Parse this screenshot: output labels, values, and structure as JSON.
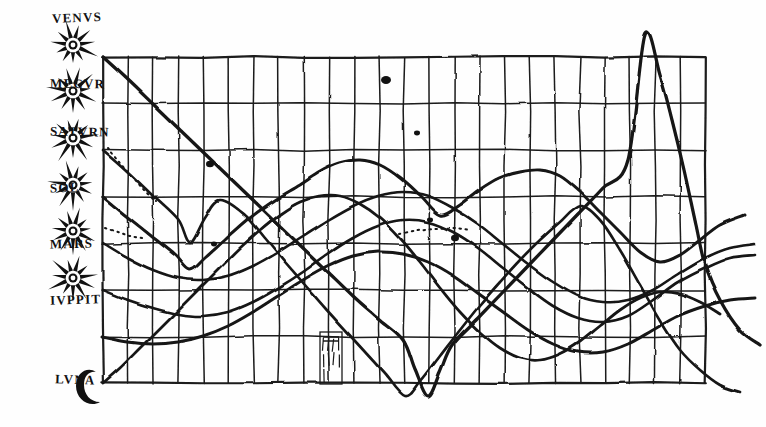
{
  "figure": {
    "medium": "ink on parchment facsimile",
    "ink_color": "#1a1a1a",
    "paper_color": "#fefefe"
  },
  "axis": {
    "label_header": "",
    "glyph_name": "eight-pointed-star",
    "moon_glyph_name": "crescent-moon",
    "bodies": [
      {
        "id": "venus",
        "label": "VENVS",
        "row": 0,
        "y": 57,
        "label_y": 10,
        "glyph": "star"
      },
      {
        "id": "mercury",
        "label": "MECVR",
        "row": 1,
        "y": 103,
        "label_y": 76,
        "glyph": "star"
      },
      {
        "id": "saturn",
        "label": "SATVRN",
        "row": 2,
        "y": 150,
        "label_y": 124,
        "glyph": "star"
      },
      {
        "id": "sol",
        "label": "SOL",
        "row": 3,
        "y": 197,
        "label_y": 180,
        "glyph": "star"
      },
      {
        "id": "mars",
        "label": "MARS",
        "row": 4,
        "y": 243,
        "label_y": 236,
        "glyph": "star"
      },
      {
        "id": "jupiter",
        "label": "IVPPIT",
        "row": 5,
        "y": 290,
        "label_y": 292,
        "glyph": "star"
      },
      {
        "id": "luna",
        "label": "LVNA",
        "row": 6,
        "y": 337,
        "label_y": 372,
        "glyph": "crescent"
      }
    ]
  },
  "annotations": [
    {
      "id": "hatched-cell",
      "name": "tally-hatch-mark",
      "x": 320,
      "y": 332,
      "w": 22,
      "h": 52,
      "text": ""
    }
  ],
  "chart_data": {
    "type": "line",
    "xlabel": "",
    "ylabel": "",
    "grid": true,
    "legend_position": "left-axis",
    "axis_note": "Left axis rows are labelled with the seven classical planets; horizontal axis is an unlabelled time grid of ~24 equal columns.",
    "grid_spec": {
      "x0": 103,
      "x1": 705,
      "y0": 57,
      "y1": 383,
      "columns": 24,
      "rows": 7,
      "col_step": 25.1,
      "row_step": 46.6
    },
    "categories": [
      "1",
      "2",
      "3",
      "4",
      "5",
      "6",
      "7",
      "8",
      "9",
      "10",
      "11",
      "12",
      "13",
      "14",
      "15",
      "16",
      "17",
      "18",
      "19",
      "20",
      "21",
      "22",
      "23",
      "24"
    ],
    "series": [
      {
        "name": "VENVS",
        "id": "venus",
        "style": "solid",
        "points": [
          [
            103,
            57
          ],
          [
            128,
            80
          ],
          [
            153,
            104
          ],
          [
            178,
            128
          ],
          [
            203,
            152
          ],
          [
            228,
            176
          ],
          [
            253,
            200
          ],
          [
            278,
            224
          ],
          [
            303,
            248
          ],
          [
            328,
            272
          ],
          [
            353,
            296
          ],
          [
            378,
            318
          ],
          [
            403,
            340
          ],
          [
            415,
            370
          ],
          [
            428,
            396
          ],
          [
            440,
            372
          ],
          [
            452,
            345
          ],
          [
            478,
            318
          ],
          [
            503,
            292
          ],
          [
            528,
            266
          ],
          [
            553,
            240
          ],
          [
            578,
            214
          ],
          [
            603,
            188
          ],
          [
            628,
            160
          ],
          [
            645,
            35
          ],
          [
            660,
            75
          ],
          [
            672,
            120
          ],
          [
            684,
            170
          ],
          [
            696,
            225
          ],
          [
            705,
            265
          ],
          [
            720,
            300
          ],
          [
            740,
            330
          ],
          [
            760,
            345
          ]
        ]
      },
      {
        "name": "MECVR",
        "id": "mercury",
        "style": "solid",
        "points": [
          [
            103,
            150
          ],
          [
            128,
            172
          ],
          [
            153,
            196
          ],
          [
            178,
            220
          ],
          [
            190,
            243
          ],
          [
            205,
            218
          ],
          [
            220,
            200
          ],
          [
            245,
            215
          ],
          [
            265,
            238
          ],
          [
            285,
            262
          ],
          [
            305,
            285
          ],
          [
            325,
            308
          ],
          [
            345,
            330
          ],
          [
            365,
            352
          ],
          [
            385,
            374
          ],
          [
            405,
            396
          ],
          [
            420,
            382
          ],
          [
            440,
            356
          ],
          [
            460,
            330
          ],
          [
            480,
            305
          ],
          [
            500,
            282
          ],
          [
            520,
            260
          ],
          [
            540,
            240
          ],
          [
            560,
            222
          ],
          [
            580,
            206
          ],
          [
            600,
            220
          ],
          [
            620,
            250
          ],
          [
            640,
            285
          ],
          [
            660,
            320
          ],
          [
            680,
            350
          ],
          [
            700,
            370
          ],
          [
            720,
            385
          ],
          [
            740,
            392
          ]
        ]
      },
      {
        "name": "SATVRN",
        "id": "saturn",
        "style": "solid",
        "points": [
          [
            103,
            197
          ],
          [
            125,
            215
          ],
          [
            150,
            235
          ],
          [
            175,
            255
          ],
          [
            190,
            270
          ],
          [
            205,
            258
          ],
          [
            225,
            240
          ],
          [
            250,
            218
          ],
          [
            275,
            200
          ],
          [
            300,
            185
          ],
          [
            320,
            172
          ],
          [
            340,
            163
          ],
          [
            360,
            160
          ],
          [
            380,
            165
          ],
          [
            400,
            178
          ],
          [
            420,
            196
          ],
          [
            440,
            215
          ],
          [
            460,
            205
          ],
          [
            480,
            190
          ],
          [
            500,
            178
          ],
          [
            520,
            172
          ],
          [
            540,
            170
          ],
          [
            560,
            176
          ],
          [
            580,
            192
          ],
          [
            600,
            212
          ],
          [
            620,
            232
          ],
          [
            640,
            252
          ],
          [
            660,
            262
          ],
          [
            680,
            255
          ],
          [
            700,
            240
          ],
          [
            720,
            225
          ],
          [
            745,
            215
          ]
        ]
      },
      {
        "name": "SOL",
        "id": "sol",
        "style": "solid",
        "points": [
          [
            103,
            243
          ],
          [
            128,
            258
          ],
          [
            153,
            270
          ],
          [
            178,
            278
          ],
          [
            203,
            280
          ],
          [
            228,
            276
          ],
          [
            253,
            266
          ],
          [
            278,
            252
          ],
          [
            303,
            236
          ],
          [
            328,
            220
          ],
          [
            353,
            206
          ],
          [
            378,
            196
          ],
          [
            403,
            192
          ],
          [
            428,
            196
          ],
          [
            453,
            208
          ],
          [
            478,
            224
          ],
          [
            503,
            244
          ],
          [
            528,
            264
          ],
          [
            553,
            282
          ],
          [
            578,
            296
          ],
          [
            603,
            302
          ],
          [
            628,
            300
          ],
          [
            653,
            290
          ],
          [
            678,
            274
          ],
          [
            705,
            258
          ],
          [
            730,
            248
          ],
          [
            755,
            244
          ]
        ]
      },
      {
        "name": "MARS",
        "id": "mars",
        "style": "solid",
        "points": [
          [
            103,
            290
          ],
          [
            128,
            300
          ],
          [
            153,
            308
          ],
          [
            178,
            314
          ],
          [
            203,
            316
          ],
          [
            228,
            312
          ],
          [
            253,
            302
          ],
          [
            278,
            288
          ],
          [
            303,
            272
          ],
          [
            328,
            254
          ],
          [
            353,
            238
          ],
          [
            378,
            226
          ],
          [
            403,
            220
          ],
          [
            428,
            222
          ],
          [
            453,
            232
          ],
          [
            478,
            248
          ],
          [
            503,
            268
          ],
          [
            528,
            288
          ],
          [
            553,
            306
          ],
          [
            578,
            318
          ],
          [
            603,
            322
          ],
          [
            628,
            316
          ],
          [
            653,
            300
          ],
          [
            678,
            282
          ],
          [
            705,
            268
          ],
          [
            730,
            258
          ],
          [
            755,
            255
          ]
        ]
      },
      {
        "name": "IVPPIT",
        "id": "jupiter",
        "style": "solid",
        "points": [
          [
            103,
            337
          ],
          [
            128,
            342
          ],
          [
            153,
            344
          ],
          [
            178,
            342
          ],
          [
            203,
            336
          ],
          [
            228,
            326
          ],
          [
            253,
            312
          ],
          [
            278,
            296
          ],
          [
            303,
            280
          ],
          [
            328,
            266
          ],
          [
            353,
            256
          ],
          [
            378,
            252
          ],
          [
            403,
            254
          ],
          [
            428,
            262
          ],
          [
            453,
            276
          ],
          [
            478,
            294
          ],
          [
            503,
            312
          ],
          [
            528,
            330
          ],
          [
            553,
            344
          ],
          [
            578,
            352
          ],
          [
            603,
            352
          ],
          [
            628,
            344
          ],
          [
            653,
            330
          ],
          [
            678,
            316
          ],
          [
            705,
            306
          ],
          [
            730,
            300
          ],
          [
            755,
            298
          ]
        ]
      },
      {
        "name": "LVNA",
        "id": "luna",
        "style": "solid",
        "points": [
          [
            103,
            383
          ],
          [
            120,
            368
          ],
          [
            140,
            348
          ],
          [
            160,
            328
          ],
          [
            180,
            308
          ],
          [
            200,
            288
          ],
          [
            220,
            268
          ],
          [
            240,
            248
          ],
          [
            260,
            230
          ],
          [
            280,
            214
          ],
          [
            300,
            202
          ],
          [
            320,
            196
          ],
          [
            340,
            196
          ],
          [
            360,
            204
          ],
          [
            380,
            218
          ],
          [
            400,
            238
          ],
          [
            420,
            262
          ],
          [
            440,
            288
          ],
          [
            460,
            312
          ],
          [
            480,
            332
          ],
          [
            500,
            348
          ],
          [
            520,
            358
          ],
          [
            540,
            360
          ],
          [
            560,
            354
          ],
          [
            580,
            342
          ],
          [
            600,
            326
          ],
          [
            620,
            310
          ],
          [
            640,
            298
          ],
          [
            660,
            292
          ],
          [
            680,
            294
          ],
          [
            700,
            302
          ],
          [
            720,
            314
          ]
        ]
      },
      {
        "name": "dotted-guide",
        "id": "dotted",
        "style": "dotted",
        "points": [
          [
            108,
            148
          ],
          [
            120,
            162
          ],
          [
            132,
            176
          ],
          [
            144,
            190
          ],
          [
            156,
            202
          ]
        ]
      },
      {
        "name": "dotted-guide-2",
        "id": "dotted2",
        "style": "dotted",
        "points": [
          [
            400,
            234
          ],
          [
            418,
            230
          ],
          [
            436,
            228
          ],
          [
            454,
            228
          ],
          [
            470,
            230
          ]
        ]
      },
      {
        "name": "dotted-guide-3",
        "id": "dotted3",
        "style": "dotted",
        "points": [
          [
            106,
            228
          ],
          [
            118,
            232
          ],
          [
            130,
            236
          ],
          [
            142,
            238
          ]
        ]
      }
    ],
    "extra_marks": [
      {
        "id": "blob-1",
        "x": 210,
        "y": 164,
        "r": 4
      },
      {
        "id": "blob-2",
        "x": 214,
        "y": 244,
        "r": 3
      },
      {
        "id": "blob-3",
        "x": 386,
        "y": 80,
        "r": 5
      },
      {
        "id": "blob-4",
        "x": 417,
        "y": 133,
        "r": 3
      },
      {
        "id": "blob-5",
        "x": 455,
        "y": 238,
        "r": 4
      },
      {
        "id": "blob-6",
        "x": 430,
        "y": 220,
        "r": 3
      }
    ]
  }
}
